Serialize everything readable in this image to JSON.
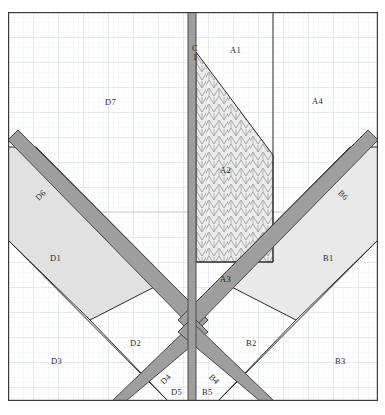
{
  "figure": {
    "paper": {
      "background_color": "#ffffff",
      "grid_color": "#dfe4ea",
      "grid_minor_spacing_px": 5,
      "grid_major_spacing_px": 25,
      "frame_color": "#3a3a3a"
    },
    "colors": {
      "band_fill": "#9a9a9a",
      "band_stroke": "#4a4a4a",
      "region_fill_light": "#e3e3e3",
      "region_fill_white": "#fdfdfd",
      "hatch_fill": "#ebebeb",
      "hatch_stroke": "#9a9a9a",
      "outline": "#262626",
      "label_color": "#2b2b2b"
    }
  },
  "labels": [
    {
      "id": "C1",
      "text_lines": [
        "C",
        "1"
      ],
      "x": 192,
      "y": 44,
      "style": "stack",
      "region": "center-vertical-band"
    },
    {
      "id": "A1",
      "text": "A1",
      "x": 238,
      "y": 45,
      "style": "plain"
    },
    {
      "id": "A2",
      "text": "A2",
      "x": 228,
      "y": 165,
      "style": "plain"
    },
    {
      "id": "A3",
      "text": "A3",
      "x": 228,
      "y": 274,
      "style": "plain"
    },
    {
      "id": "A4",
      "text": "A4",
      "x": 320,
      "y": 96,
      "style": "plain"
    },
    {
      "id": "D7",
      "text": "D7",
      "x": 113,
      "y": 97,
      "style": "plain"
    },
    {
      "id": "D6",
      "text": "D6",
      "x": 41,
      "y": 190,
      "style": "rot-d"
    },
    {
      "id": "D1",
      "text": "D1",
      "x": 57,
      "y": 253,
      "style": "plain"
    },
    {
      "id": "D2",
      "text": "D2",
      "x": 137,
      "y": 338,
      "style": "plain"
    },
    {
      "id": "D3",
      "text": "D3",
      "x": 58,
      "y": 356,
      "style": "plain"
    },
    {
      "id": "D4",
      "text": "D4",
      "x": 167,
      "y": 374,
      "style": "rot-d"
    },
    {
      "id": "D5",
      "text": "D5",
      "x": 178,
      "y": 387,
      "style": "plain"
    },
    {
      "id": "B6",
      "text": "B6",
      "x": 344,
      "y": 190,
      "style": "rot-b"
    },
    {
      "id": "B1",
      "text": "B1",
      "x": 330,
      "y": 253,
      "style": "plain"
    },
    {
      "id": "B2",
      "text": "B2",
      "x": 253,
      "y": 338,
      "style": "plain"
    },
    {
      "id": "B3",
      "text": "B3",
      "x": 342,
      "y": 356,
      "style": "plain"
    },
    {
      "id": "B4",
      "text": "B4",
      "x": 216,
      "y": 374,
      "style": "rot-b"
    },
    {
      "id": "B5",
      "text": "B5",
      "x": 209,
      "y": 387,
      "style": "plain"
    }
  ],
  "regions": [
    {
      "name": "A1",
      "fill": "white",
      "description": "upper-centre-right open panel"
    },
    {
      "name": "A2",
      "fill": "hatched",
      "description": "central zigzag-hatched wedge"
    },
    {
      "name": "A3",
      "fill": "white",
      "description": "lower central panel"
    },
    {
      "name": "A4",
      "fill": "white",
      "description": "upper right open panel"
    },
    {
      "name": "B1",
      "fill": "light",
      "description": "right shaded parallelogram"
    },
    {
      "name": "B2",
      "fill": "white",
      "description": "right lower panel"
    },
    {
      "name": "B3",
      "fill": "white",
      "description": "right bottom corner panel"
    },
    {
      "name": "B4",
      "fill": "band",
      "description": "right lower diagonal band"
    },
    {
      "name": "B5",
      "fill": "white",
      "description": "bottom centre-right panel"
    },
    {
      "name": "B6",
      "fill": "band",
      "description": "right upper diagonal band"
    },
    {
      "name": "C1",
      "fill": "band",
      "description": "central vertical band"
    },
    {
      "name": "D1",
      "fill": "light",
      "description": "left shaded parallelogram"
    },
    {
      "name": "D2",
      "fill": "white",
      "description": "left lower panel"
    },
    {
      "name": "D3",
      "fill": "white",
      "description": "left bottom corner panel"
    },
    {
      "name": "D4",
      "fill": "band",
      "description": "left lower diagonal band"
    },
    {
      "name": "D5",
      "fill": "white",
      "description": "bottom centre-left panel"
    },
    {
      "name": "D6",
      "fill": "band",
      "description": "left upper diagonal band"
    },
    {
      "name": "D7",
      "fill": "white",
      "description": "upper left large open panel"
    }
  ]
}
